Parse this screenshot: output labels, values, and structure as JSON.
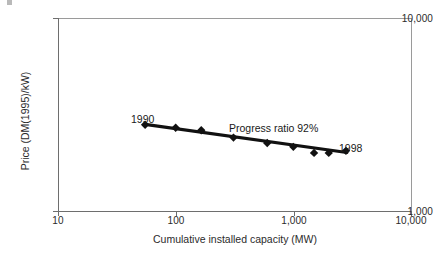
{
  "chart_data": {
    "type": "scatter",
    "title": "",
    "subtitle": "",
    "xlabel": "Cumulative installed capacity (MW)",
    "ylabel": "Price (DM(1995)/kW)",
    "xscale": "log",
    "yscale": "log",
    "xlim": [
      10,
      10000
    ],
    "ylim": [
      1000,
      10000
    ],
    "grid": false,
    "legend": null,
    "x_ticks": [
      {
        "value": 10,
        "label": "10"
      },
      {
        "value": 100,
        "label": "100"
      },
      {
        "value": 1000,
        "label": "1,000"
      },
      {
        "value": 10000,
        "label": "10,000"
      }
    ],
    "y_ticks": [
      {
        "value": 1000,
        "label": "1,000"
      },
      {
        "value": 10000,
        "label": "10,000"
      }
    ],
    "series": [
      {
        "name": "Wind turbine price vs cumulative capacity",
        "marker": "diamond",
        "marker_color": "#111111",
        "line_color": "#111111",
        "x": [
          55,
          100,
          165,
          310,
          600,
          1000,
          1500,
          2000,
          2800
        ],
        "y": [
          2800,
          2700,
          2620,
          2400,
          2250,
          2150,
          2000,
          2000,
          2050
        ],
        "points": [
          {
            "x": 55,
            "y": 2800
          },
          {
            "x": 100,
            "y": 2700
          },
          {
            "x": 165,
            "y": 2620
          },
          {
            "x": 310,
            "y": 2400
          },
          {
            "x": 600,
            "y": 2250
          },
          {
            "x": 1000,
            "y": 2150
          },
          {
            "x": 1500,
            "y": 2000
          },
          {
            "x": 2000,
            "y": 2000
          },
          {
            "x": 2800,
            "y": 2050
          }
        ]
      },
      {
        "name": "Experience-curve fit",
        "type": "line",
        "line_color": "#111111",
        "x": [
          55,
          2850
        ],
        "y": [
          2810,
          2010
        ]
      }
    ],
    "annotations": [
      {
        "text": "1990",
        "x": 55,
        "y": 2800,
        "position": "above-left"
      },
      {
        "text": "1998",
        "x": 2800,
        "y": 2050,
        "position": "above-right"
      },
      {
        "text": "Progress ratio 92%",
        "x": 450,
        "y": 2700,
        "position": "above"
      }
    ]
  },
  "axes": {
    "x_title": "Cumulative installed capacity (MW)",
    "y_title": "Price (DM(1995)/kW)",
    "x_tick_labels": [
      "10",
      "100",
      "1,000",
      "10,000"
    ],
    "y_tick_labels": [
      "1,000",
      "10,000"
    ]
  },
  "annotations": {
    "start_year": "1990",
    "end_year": "1998",
    "progress_ratio": "Progress ratio 92%"
  },
  "colors": {
    "data": "#111111",
    "axis": "#6e6e6e",
    "frame": "#9a9a9a",
    "text": "#2b2b2b",
    "background": "#ffffff"
  }
}
